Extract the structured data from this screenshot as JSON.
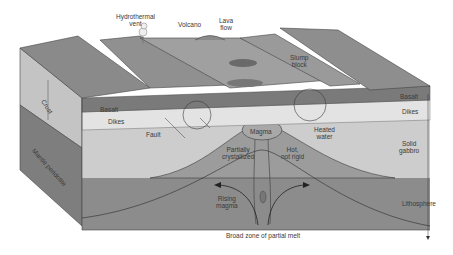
{
  "figure": {
    "labels": {
      "hydrothermal_vent": "Hydrothermal\nvent",
      "volcano": "Volcano",
      "lava_flow": "Lava\nflow",
      "slump_block": "Slump\nblock",
      "basalt_left": "Basalt",
      "dikes_left": "Dikes",
      "basalt_right": "Basalt",
      "dikes_right": "Dikes",
      "crust": "Crust",
      "mantle_peridotite": "Mantle peridotite",
      "fault": "Fault",
      "magma": "Magma",
      "heated_water": "Heated\nwater",
      "partially_crystallized": "Partially\ncrystallized",
      "hot_not_rigid": "Hot,\nnot rigid",
      "solid_gabbro": "Solid\ngabbro",
      "rising_magma": "Rising\nmagma",
      "lithosphere": "Lithosphere",
      "partial_melt": "Broad zone of partial melt"
    },
    "colors": {
      "background": "#ffffff",
      "seafloor_top": "#8f8f8f",
      "basalt": "#7d7d7d",
      "dikes": "#d9d9d9",
      "gabbro": "#c9c9c9",
      "mantle": "#8a8a8a",
      "magma_chamber": "#a3a3a3",
      "line": "#3a3a3a"
    }
  }
}
